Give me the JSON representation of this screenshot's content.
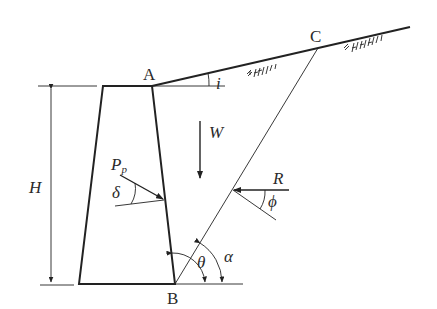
{
  "diagram": {
    "colors": {
      "line": "#222222",
      "background": "#ffffff",
      "text": "#2a2a2a"
    },
    "points": {
      "A": {
        "label": "A"
      },
      "B": {
        "label": "B"
      },
      "C": {
        "label": "C"
      }
    },
    "labels": {
      "height": "H",
      "weight": "W",
      "passive_force": "P",
      "passive_force_sub": "p",
      "wall_friction": "δ",
      "reaction": "R",
      "soil_friction": "ϕ",
      "wall_angle": "θ",
      "plane_angle": "α",
      "slope_angle": "i"
    },
    "elements": [
      "retaining-wall (trapezoid)",
      "backfill ground surface inclined at angle i with hatching",
      "trial failure plane BC",
      "weight arrow W (downward)",
      "passive force arrow Pp on wall back with angle δ",
      "reaction arrow R on plane BC with angle ϕ",
      "angle θ between wall back and horizontal at B",
      "angle α between plane BC and horizontal at B",
      "height dimension H"
    ]
  }
}
